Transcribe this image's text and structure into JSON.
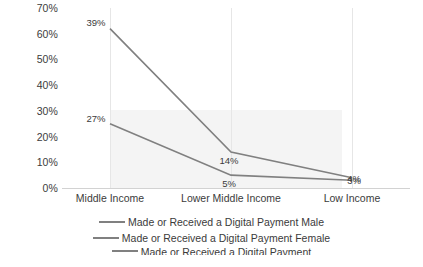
{
  "chart_data": {
    "type": "line",
    "title": "",
    "xlabel": "",
    "ylabel": "",
    "categories": [
      "Middle Income",
      "Lower Middle Income",
      "Low Income"
    ],
    "ylim": [
      0,
      70
    ],
    "yticks": [
      70,
      60,
      50,
      40,
      30,
      20,
      10,
      0
    ],
    "ytick_labels": [
      "70%",
      "60%",
      "50%",
      "40%",
      "30%",
      "20%",
      "10%",
      "0%"
    ],
    "grid": "vertical-only",
    "legend_position": "bottom",
    "series": [
      {
        "name": "Made or Received a Digital Payment Male",
        "color": "#808080",
        "values": [
          62,
          14,
          4
        ],
        "labels": [
          "39%",
          "14%",
          "4%"
        ]
      },
      {
        "name": "Made or Received a Digital Payment Female",
        "color": "#808080",
        "values": [
          25,
          5,
          3
        ],
        "labels": [
          "27%",
          "5%",
          "3%"
        ]
      }
    ],
    "annotations": []
  },
  "legend": {
    "items": [
      {
        "label": "Made or Received a Digital Payment Male",
        "color": "#808080"
      },
      {
        "label": "Made or Received a Digital Payment Female",
        "color": "#808080"
      },
      {
        "label": "Made or Received a Digital Payment",
        "color": "#808080"
      }
    ]
  }
}
